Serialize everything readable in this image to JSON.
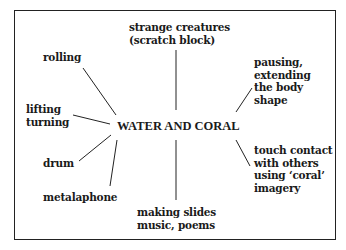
{
  "diagram": {
    "center": "WATER AND CORAL",
    "nodes": [
      {
        "id": "strange-creatures",
        "text": "strange creatures\n(scratch block)"
      },
      {
        "id": "rolling",
        "text": "rolling"
      },
      {
        "id": "pausing",
        "text": "pausing,\nextending\nthe body\nshape"
      },
      {
        "id": "lifting",
        "text": "lifting\nturning"
      },
      {
        "id": "touch",
        "text": "touch contact\nwith others\nusing ‘coral’\nimagery"
      },
      {
        "id": "drum",
        "text": "drum"
      },
      {
        "id": "metalaphone",
        "text": "metalaphone"
      },
      {
        "id": "making-slides",
        "text": "making slides\nmusic, poems"
      }
    ]
  }
}
